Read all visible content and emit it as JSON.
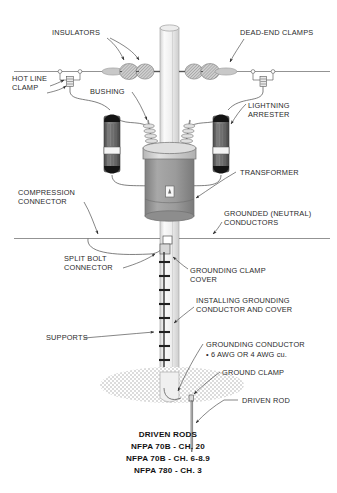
{
  "diagram": {
    "title_caption": {
      "line1": "DRIVEN RODS",
      "line2": "NFPA 70B - CH. 20",
      "line3": "NFPA 70B - CH. 6-8.9",
      "line4": "NFPA 780 - CH. 3"
    },
    "labels": {
      "insulators": "INSULATORS",
      "dead_end_clamps": "DEAD-END CLAMPS",
      "hot_line_clamp_1": "HOT LINE",
      "hot_line_clamp_2": "CLAMP",
      "bushing": "BUSHING",
      "lightning_arrester_1": "LIGHTNING",
      "lightning_arrester_2": "ARRESTER",
      "transformer": "TRANSFORMER",
      "compression_connector_1": "COMPRESSION",
      "compression_connector_2": "CONNECTOR",
      "grounded_neutral_1": "GROUNDED (NEUTRAL)",
      "grounded_neutral_2": "CONDUCTORS",
      "split_bolt_1": "SPLIT BOLT",
      "split_bolt_2": "CONNECTOR",
      "grounding_clamp_cover_1": "GROUNDING CLAMP",
      "grounding_clamp_cover_2": "COVER",
      "installing_1": "INSTALLING GROUNDING",
      "installing_2": "CONDUCTOR AND COVER",
      "supports": "SUPPORTS",
      "grounding_conductor_1": "GROUNDING CONDUCTOR",
      "grounding_conductor_2": "• 6 AWG OR 4 AWG cu.",
      "ground_clamp": "GROUND CLAMP",
      "driven_rod": "DRIVEN ROD"
    },
    "colors": {
      "background": "#ffffff",
      "text": "#2b2b2b",
      "leader": "#3a3a3a",
      "pole_light": "#f2f2f2",
      "pole_mid": "#dcdcdc",
      "transformer_body": "#9a9a9a",
      "transformer_cap": "#cfcfcf",
      "arrester_body": "#6e6e6e",
      "arrester_end": "#171717",
      "insulator": "#b9b9b9",
      "ground_stipple": "#b5b5b5"
    }
  }
}
